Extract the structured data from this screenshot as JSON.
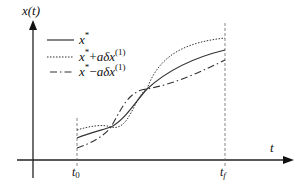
{
  "diagram": {
    "y_axis_label": "x(t)",
    "x_axis_label": "t",
    "ticks": {
      "t0": {
        "base": "t",
        "sub": "0"
      },
      "tf": {
        "base": "t",
        "sub": "f"
      }
    },
    "legend": [
      {
        "style": "solid",
        "base": "x",
        "star": "*",
        "op": "",
        "term": "",
        "sup": ""
      },
      {
        "style": "dotted",
        "base": "x",
        "star": "*",
        "op": "+",
        "term": "aδx",
        "sup": "(1)"
      },
      {
        "style": "dash-dot",
        "base": "x",
        "star": "*",
        "op": "−",
        "term": "aδx",
        "sup": "(1)"
      }
    ],
    "colors": {
      "line": "#333333",
      "axis": "#222222",
      "guide": "#666666"
    }
  }
}
